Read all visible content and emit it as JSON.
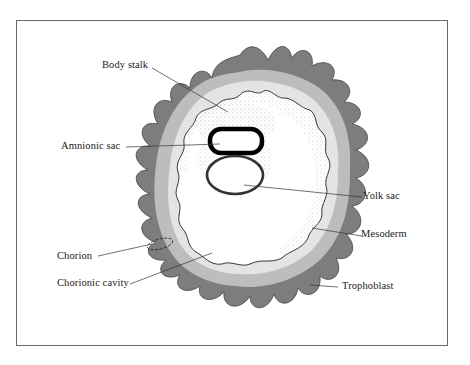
{
  "diagram": {
    "labels": {
      "body_stalk": "Body stalk",
      "amnionic_sac": "Amnionic sac",
      "yolk_sac": "Yolk sac",
      "mesoderm": "Mesoderm",
      "chorion": "Chorion",
      "chorionic_cavity": "Chorionic cavity",
      "trophoblast": "Trophoblast"
    },
    "colors": {
      "trophoblast_dark": "#7a7a7a",
      "chorion_mid": "#b5b5b5",
      "chorion_light": "#e2e2e2",
      "stipple": "#888888",
      "amnion_outline": "#000000",
      "frame": "#6a6a6a"
    }
  }
}
